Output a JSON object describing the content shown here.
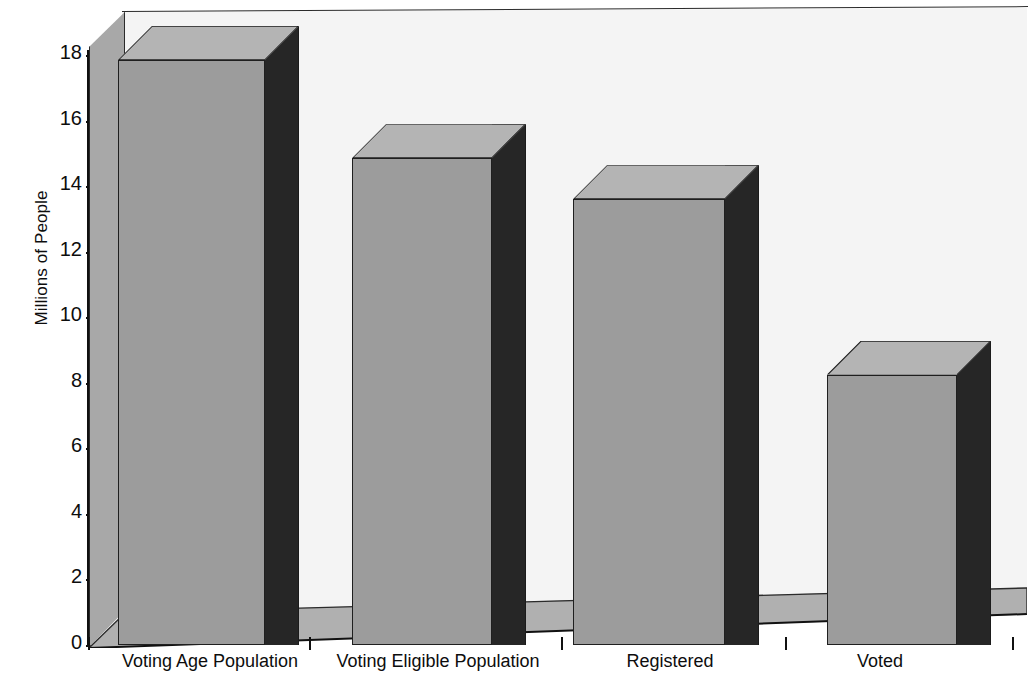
{
  "chart_data": {
    "type": "bar",
    "title": "",
    "subtitle": "",
    "xlabel": "",
    "ylabel": "Millions of People",
    "categories": [
      "Voting Age Population",
      "Voting Eligible Population",
      "Registered",
      "Voted"
    ],
    "values": [
      17.85,
      14.85,
      13.6,
      8.25
    ],
    "ylim": [
      0,
      18
    ],
    "yticks": [
      0,
      2,
      4,
      6,
      8,
      10,
      12,
      14,
      16,
      18
    ],
    "ytick_labels": [
      "0",
      "2",
      "4",
      "6",
      "8",
      "10",
      "12",
      "14",
      "16",
      "18"
    ],
    "grid": false,
    "legend": null,
    "style": "3d-perspective-bar",
    "colors": {
      "bar_front": "#9c9c9c",
      "bar_top": "#b4b4b4",
      "bar_side": "#262626",
      "plot_background": "#f4f4f4",
      "floor": "#b0b0b0",
      "left_wall": "#a8a8a8",
      "axis": "#111111",
      "text": "#0d0d0d"
    },
    "annotations": []
  },
  "axis": {
    "y_title": "Millions of People",
    "ticks": [
      {
        "label": "18",
        "value": 18
      },
      {
        "label": "16",
        "value": 16
      },
      {
        "label": "14",
        "value": 14
      },
      {
        "label": "12",
        "value": 12
      },
      {
        "label": "10",
        "value": 10
      },
      {
        "label": "8",
        "value": 8
      },
      {
        "label": "6",
        "value": 6
      },
      {
        "label": "4",
        "value": 4
      },
      {
        "label": "2",
        "value": 2
      },
      {
        "label": "0",
        "value": 0
      }
    ]
  },
  "bars": [
    {
      "label": "Voting Age Population",
      "value": 17.85
    },
    {
      "label": "Voting Eligible Population",
      "value": 14.85
    },
    {
      "label": "Registered",
      "value": 13.6
    },
    {
      "label": "Voted",
      "value": 8.25
    }
  ]
}
